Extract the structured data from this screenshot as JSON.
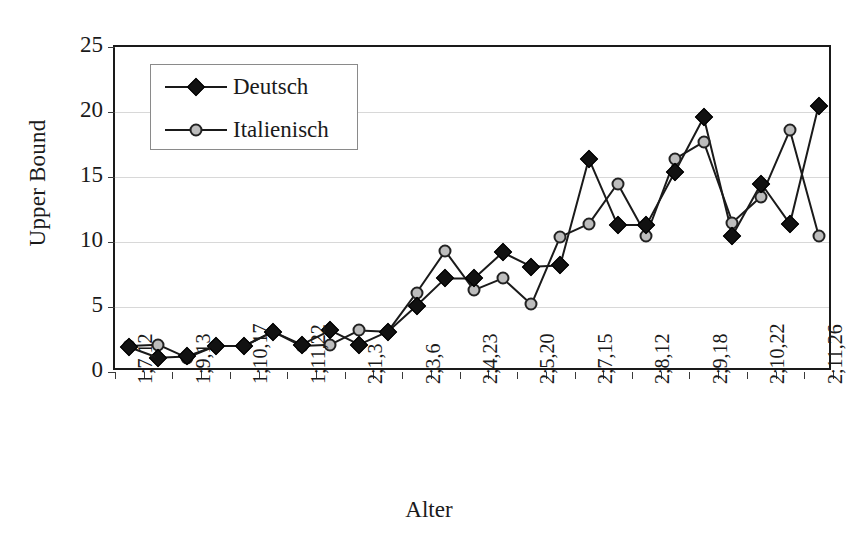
{
  "chart_data": {
    "type": "line",
    "title": "",
    "xlabel": "Alter",
    "ylabel": "Upper Bound",
    "ylim": [
      0,
      25
    ],
    "yticks": [
      0,
      5,
      10,
      15,
      20,
      25
    ],
    "grid": true,
    "legend_position": "top-left",
    "x_tick_labels": [
      "1;7,12",
      "1;9,13",
      "1;10,17",
      "1;11,22",
      "2;1,3",
      "2;3,6",
      "2;4,23",
      "2;5,20",
      "2;7,15",
      "2;8,12",
      "2;9,18",
      "2;10,22",
      "2;11,26"
    ],
    "n_points": 26,
    "series": [
      {
        "name": "Deutsch",
        "marker": "diamond",
        "color": "#111111",
        "values": [
          1.9,
          1.1,
          1.2,
          2.0,
          2.0,
          3.1,
          2.1,
          3.2,
          2.1,
          3.1,
          5.1,
          7.2,
          7.2,
          9.2,
          8.1,
          8.2,
          16.4,
          11.3,
          11.3,
          15.4,
          19.6,
          10.5,
          14.5,
          11.4,
          20.5
        ]
      },
      {
        "name": "Italienisch",
        "marker": "circle",
        "color": "#bdbdbd",
        "values": [
          2.0,
          2.1,
          1.1,
          2.0,
          2.0,
          3.1,
          2.0,
          2.1,
          3.2,
          3.1,
          6.1,
          9.3,
          6.3,
          7.2,
          5.2,
          10.4,
          11.4,
          14.5,
          10.5,
          16.4,
          17.7,
          11.5,
          13.5,
          18.6,
          10.5
        ]
      }
    ]
  },
  "legend": {
    "entries": [
      {
        "label": "Deutsch"
      },
      {
        "label": "Italienisch"
      }
    ]
  },
  "axes": {
    "y_title": "Upper Bound",
    "x_title": "Alter"
  }
}
